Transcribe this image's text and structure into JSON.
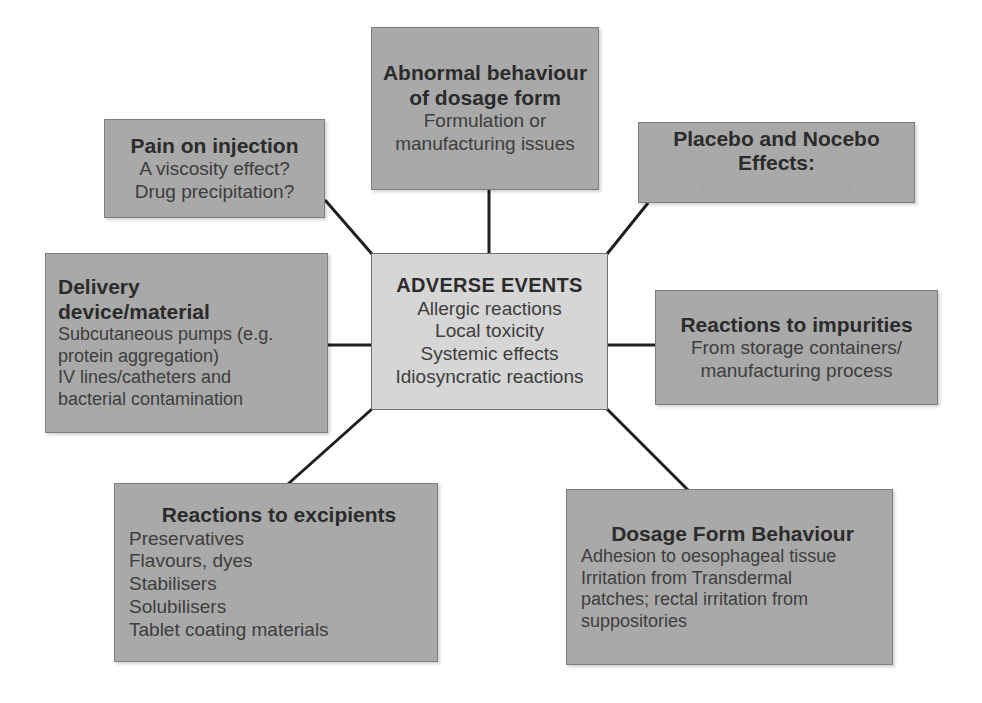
{
  "diagram": {
    "colors": {
      "node_fill": "#a9a9a9",
      "center_fill": "#d6d6d6",
      "node_border": "#7d7d7d",
      "connector": "#222222",
      "text": "#3a3a3a",
      "background": "#ffffff"
    },
    "center": {
      "title": "ADVERSE EVENTS",
      "lines": [
        "Allergic reactions",
        "Local toxicity",
        "Systemic effects",
        "Idiosyncratic reactions"
      ]
    },
    "nodes": [
      {
        "id": "abnormal",
        "title_lines": [
          "Abnormal behaviour",
          "of dosage form"
        ],
        "lines": [
          "Formulation or",
          "manufacturing issues"
        ]
      },
      {
        "id": "pain",
        "title_lines": [
          "Pain on injection"
        ],
        "lines": [
          "A viscosity effect?",
          "Drug precipitation?"
        ]
      },
      {
        "id": "placebo",
        "title_lines": [
          "Placebo and Nocebo",
          "Effects:"
        ],
        "faint_line": "illegible faded text"
      },
      {
        "id": "delivery",
        "title_lines": [
          "Delivery",
          "device/material"
        ],
        "lines": [
          "Subcutaneous pumps (e.g.",
          "protein aggregation)",
          "IV lines/catheters and",
          "bacterial contamination"
        ]
      },
      {
        "id": "impurities",
        "title_lines": [
          "Reactions to impurities"
        ],
        "lines": [
          "From storage containers/",
          "manufacturing process"
        ]
      },
      {
        "id": "excipients",
        "title_lines": [
          "Reactions to excipients"
        ],
        "lines": [
          "Preservatives",
          "Flavours, dyes",
          "Stabilisers",
          "Solubilisers",
          "Tablet coating materials"
        ]
      },
      {
        "id": "dosage",
        "title_lines": [
          "Dosage Form Behaviour"
        ],
        "lines": [
          "Adhesion to oesophageal tissue",
          "Irritation from Transdermal",
          "patches; rectal irritation from",
          "suppositories"
        ]
      }
    ]
  }
}
